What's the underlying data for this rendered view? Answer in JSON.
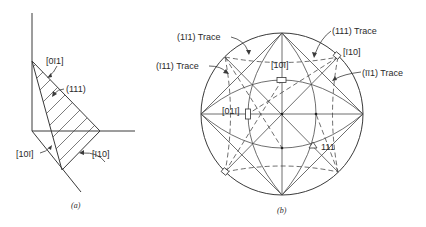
{
  "figure_a": {
    "caption": "(a)",
    "labels": {
      "dir_0m11": "[0ī1]",
      "plane_111": "(111)",
      "dir_10m1": "[10ī]",
      "dir_m110": "[ī10]"
    }
  },
  "figure_b": {
    "caption": "(b)",
    "labels": {
      "trace_1m11": "(1ī1)  Trace",
      "trace_m111": "(ī11)  Trace",
      "trace_111": "(111)  Trace",
      "trace_m1m11": "(īī1)  Trace",
      "dir_m110": "[ī10]",
      "dir_10m1": "[10ī]",
      "dir_01m1": "[01ī]",
      "pole_111": "111"
    }
  }
}
